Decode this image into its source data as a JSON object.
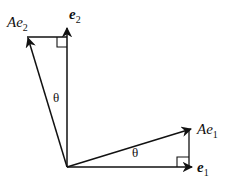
{
  "diagram": {
    "labels": {
      "Ae2_base": "Ae",
      "Ae2_sub": "2",
      "e2_base": "e",
      "e2_sub": "2",
      "Ae1_base": "Ae",
      "Ae1_sub": "1",
      "e1_base": "e",
      "e1_sub": "1",
      "theta_upper": "θ",
      "theta_lower": "θ"
    },
    "vectors": [
      {
        "name": "e1",
        "from": [
          67,
          167
        ],
        "to": [
          192,
          167
        ]
      },
      {
        "name": "e2",
        "from": [
          67,
          167
        ],
        "to": [
          67,
          28
        ]
      },
      {
        "name": "Ae1",
        "from": [
          67,
          167
        ],
        "to": [
          192,
          129
        ]
      },
      {
        "name": "Ae2",
        "from": [
          67,
          167
        ],
        "to": [
          27,
          37
        ]
      }
    ],
    "colors": {
      "stroke": "#111111",
      "background": "#ffffff"
    }
  }
}
